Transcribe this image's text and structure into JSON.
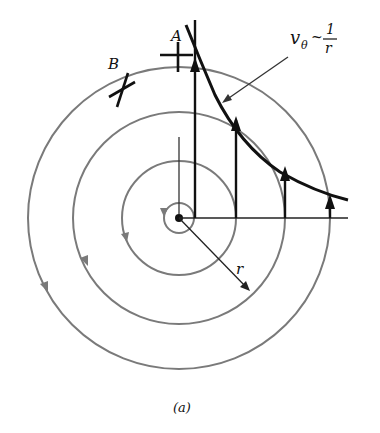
{
  "figure": {
    "caption": "(a)",
    "labels": {
      "point_a": "A",
      "point_b": "B",
      "radius": "r",
      "velocity_symbol": "v",
      "velocity_subscript": "θ",
      "proportional": "~",
      "fraction_numerator": "1",
      "fraction_denominator": "r"
    },
    "colors": {
      "streamlines": "#7a7a7a",
      "velocity_vectors": "#111111",
      "profile_curve": "#111111"
    },
    "center": {
      "x": 179,
      "y": 218
    },
    "streamline_radii": [
      15,
      57,
      106,
      151
    ],
    "velocity_vectors": [
      {
        "x": 195,
        "top_y": 12
      },
      {
        "x": 236,
        "top_y": 112
      },
      {
        "x": 285,
        "top_y": 163
      },
      {
        "x": 330,
        "top_y": 192
      }
    ]
  }
}
